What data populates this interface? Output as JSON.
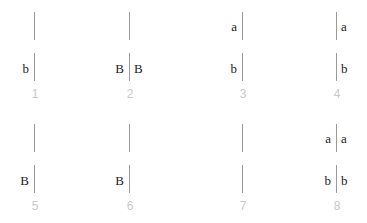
{
  "panels": [
    {
      "number": "1",
      "top_left": "",
      "top_right": "",
      "bottom_left": "b",
      "bottom_right": ""
    },
    {
      "number": "2",
      "top_left": "",
      "top_right": "",
      "bottom_left": "B",
      "bottom_right": "B"
    },
    {
      "number": "3",
      "top_left": "a",
      "top_right": "",
      "bottom_left": "b",
      "bottom_right": ""
    },
    {
      "number": "4",
      "top_left": "",
      "top_right": "a",
      "bottom_left": "",
      "bottom_right": "b"
    },
    {
      "number": "5",
      "top_left": "",
      "top_right": "",
      "bottom_left": "B",
      "bottom_right": ""
    },
    {
      "number": "6",
      "top_left": "",
      "top_right": "",
      "bottom_left": "B",
      "bottom_right": ""
    },
    {
      "number": "7",
      "top_left": "",
      "top_right": "",
      "bottom_left": "",
      "bottom_right": ""
    },
    {
      "number": "8",
      "top_left": "a",
      "top_right": "a",
      "bottom_left": "b",
      "bottom_right": "b"
    }
  ],
  "colors": {
    "bar": "#9a9a9a",
    "label": "#222222",
    "number": "#c8c8c8"
  }
}
